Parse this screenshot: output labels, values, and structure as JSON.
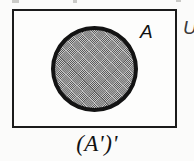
{
  "figure": {
    "kind": "venn-diagram",
    "caption": "(A')'",
    "universe_label": "U",
    "set_label": "A",
    "bleed_marks": [
      "",
      "",
      ""
    ],
    "colors": {
      "background": "#fbfbfa",
      "ink": "#1b1b1b",
      "box_fill": "#fdfdfc",
      "circle_fill": "#9a9a9a",
      "circle_outline": "#131313"
    }
  },
  "chart_data": {
    "type": "diagram",
    "title": "(A')'",
    "regions": [
      {
        "name": "U",
        "role": "universal-set",
        "shape": "rectangle",
        "shaded": false,
        "bounds": {
          "x": 12,
          "y": 9,
          "width": 165,
          "height": 119
        }
      },
      {
        "name": "A",
        "role": "set",
        "shape": "circle",
        "shaded": true,
        "bounds": {
          "x": 51,
          "y": 26,
          "width": 87,
          "height": 86
        }
      }
    ],
    "labels": [
      {
        "text": "A",
        "x": 140,
        "y": 22,
        "style": "italic"
      },
      {
        "text": "U",
        "x": 183,
        "y": 18,
        "style": "italic",
        "clipped": true
      },
      {
        "text": "(A')'",
        "x": 97,
        "y": 131,
        "style": "italic",
        "role": "caption"
      }
    ]
  }
}
